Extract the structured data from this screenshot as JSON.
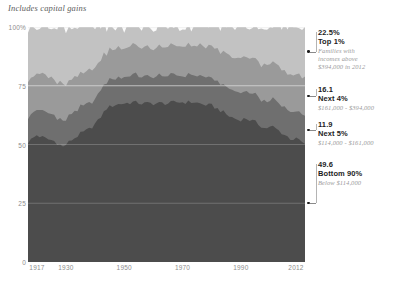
{
  "subtitle": "Includes capital gains",
  "chart_data": {
    "type": "area",
    "title": "",
    "subtitle": "Includes capital gains",
    "xlabel": "",
    "ylabel": "",
    "stacked": true,
    "percent": true,
    "xlim": [
      1917,
      2012
    ],
    "ylim": [
      0,
      100
    ],
    "grid": true,
    "legend_position": "right-annotations",
    "yticks": [
      "100%",
      "75",
      "50",
      "25",
      "0"
    ],
    "ytick_values": [
      100,
      75,
      50,
      25,
      0
    ],
    "xticks": [
      "1917",
      "1930",
      "1950",
      "1970",
      "1990",
      "2012"
    ],
    "xtick_values": [
      1917,
      1930,
      1950,
      1970,
      1990,
      2012
    ],
    "colors": {
      "bottom90": "#4c4c4c",
      "next5": "#6f6f6f",
      "next4": "#9a9a9a",
      "top1": "#c2c2c2",
      "plot_bg": "#fbfbfb",
      "gridline": "#e2e2e2",
      "text_dark": "#1d1d1d",
      "text_muted": "#9a9a9a"
    },
    "series": [
      {
        "name": "Bottom 90%",
        "color": "#4c4c4c",
        "final_value": 49.6,
        "x": [
          1917,
          1920,
          1923,
          1926,
          1929,
          1932,
          1935,
          1938,
          1941,
          1944,
          1947,
          1950,
          1953,
          1956,
          1959,
          1962,
          1965,
          1968,
          1971,
          1974,
          1977,
          1980,
          1983,
          1986,
          1989,
          1992,
          1995,
          1998,
          2001,
          2004,
          2007,
          2010,
          2012
        ],
        "values": [
          51.0,
          54.0,
          52.5,
          51.5,
          49.0,
          52.0,
          54.5,
          56.5,
          60.0,
          65.5,
          67.0,
          67.5,
          68.0,
          67.5,
          67.5,
          67.5,
          67.5,
          68.0,
          68.0,
          68.0,
          67.0,
          66.5,
          64.5,
          62.0,
          60.5,
          61.0,
          59.5,
          57.0,
          57.5,
          55.0,
          52.5,
          52.0,
          49.6
        ]
      },
      {
        "name": "Next 5%",
        "color": "#6f6f6f",
        "final_value": 11.9,
        "x": [
          1917,
          1920,
          1923,
          1926,
          1929,
          1932,
          1935,
          1938,
          1941,
          1944,
          1947,
          1950,
          1953,
          1956,
          1959,
          1962,
          1965,
          1968,
          1971,
          1974,
          1977,
          1980,
          1983,
          1986,
          1989,
          1992,
          1995,
          1998,
          2001,
          2004,
          2007,
          2010,
          2012
        ],
        "values": [
          11.0,
          11.0,
          11.0,
          11.0,
          10.5,
          11.0,
          11.0,
          11.0,
          11.0,
          11.5,
          11.5,
          11.5,
          11.5,
          11.5,
          11.5,
          11.5,
          11.5,
          11.5,
          11.5,
          11.5,
          11.5,
          11.5,
          11.5,
          11.5,
          11.5,
          11.5,
          11.5,
          11.5,
          11.5,
          11.5,
          11.5,
          11.7,
          11.9
        ]
      },
      {
        "name": "Next 4%",
        "color": "#9a9a9a",
        "final_value": 16.1,
        "x": [
          1917,
          1920,
          1923,
          1926,
          1929,
          1932,
          1935,
          1938,
          1941,
          1944,
          1947,
          1950,
          1953,
          1956,
          1959,
          1962,
          1965,
          1968,
          1971,
          1974,
          1977,
          1980,
          1983,
          1986,
          1989,
          1992,
          1995,
          1998,
          2001,
          2004,
          2007,
          2010,
          2012
        ],
        "values": [
          16.0,
          15.0,
          15.5,
          15.5,
          15.5,
          15.0,
          14.5,
          14.0,
          13.5,
          12.5,
          12.5,
          12.5,
          12.5,
          12.5,
          12.5,
          12.5,
          12.5,
          12.5,
          12.5,
          12.5,
          13.0,
          13.0,
          13.5,
          14.0,
          14.5,
          14.5,
          15.0,
          15.5,
          15.5,
          15.5,
          15.5,
          15.8,
          16.1
        ]
      },
      {
        "name": "Top 1%",
        "color": "#c2c2c2",
        "final_value": 22.5,
        "x": [
          1917,
          1920,
          1923,
          1926,
          1929,
          1932,
          1935,
          1938,
          1941,
          1944,
          1947,
          1950,
          1953,
          1956,
          1959,
          1962,
          1965,
          1968,
          1971,
          1974,
          1977,
          1980,
          1983,
          1986,
          1989,
          1992,
          1995,
          1998,
          2001,
          2004,
          2007,
          2010,
          2012
        ],
        "values": [
          22.0,
          20.0,
          21.0,
          22.0,
          25.0,
          22.0,
          20.0,
          18.5,
          15.5,
          10.5,
          9.0,
          8.5,
          8.0,
          8.5,
          8.5,
          8.5,
          8.5,
          8.0,
          8.0,
          8.0,
          8.5,
          9.0,
          10.5,
          12.5,
          13.5,
          13.0,
          14.0,
          16.0,
          15.5,
          18.0,
          20.5,
          20.5,
          22.5
        ]
      }
    ]
  },
  "annotations": [
    {
      "value": "22.5%",
      "group": "Top 1%",
      "detail_1": "Families with",
      "detail_2": "incomes above",
      "detail_3": "$394,000 in 2012"
    },
    {
      "value": "16.1",
      "group": "Next 4%",
      "detail_1": "$161,000 - $394,000",
      "detail_2": "",
      "detail_3": ""
    },
    {
      "value": "11.9",
      "group": "Next 5%",
      "detail_1": "$114,000 - $161,000",
      "detail_2": "",
      "detail_3": ""
    },
    {
      "value": "49.6",
      "group": "Bottom 90%",
      "detail_1": "Below $114,000",
      "detail_2": "",
      "detail_3": ""
    }
  ]
}
